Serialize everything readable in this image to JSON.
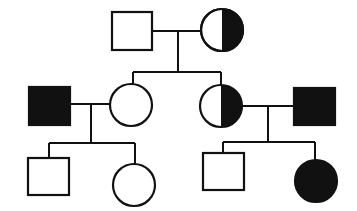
{
  "diagram": {
    "type": "pedigree",
    "colors": {
      "affected": "#111111",
      "unaffected": "#ffffff",
      "outline": "#111111"
    },
    "individuals": [
      {
        "id": "I-1",
        "generation": 1,
        "sex": "male",
        "status": "unaffected"
      },
      {
        "id": "I-2",
        "generation": 1,
        "sex": "female",
        "status": "carrier"
      },
      {
        "id": "II-1",
        "generation": 2,
        "sex": "male",
        "status": "affected"
      },
      {
        "id": "II-2",
        "generation": 2,
        "sex": "female",
        "status": "unaffected"
      },
      {
        "id": "II-3",
        "generation": 2,
        "sex": "female",
        "status": "carrier"
      },
      {
        "id": "II-4",
        "generation": 2,
        "sex": "male",
        "status": "affected"
      },
      {
        "id": "III-1",
        "generation": 3,
        "sex": "male",
        "status": "unaffected"
      },
      {
        "id": "III-2",
        "generation": 3,
        "sex": "female",
        "status": "unaffected"
      },
      {
        "id": "III-3",
        "generation": 3,
        "sex": "male",
        "status": "unaffected"
      },
      {
        "id": "III-4",
        "generation": 3,
        "sex": "female",
        "status": "affected"
      }
    ],
    "matings": [
      {
        "partners": [
          "I-1",
          "I-2"
        ],
        "children": [
          "II-2",
          "II-3"
        ]
      },
      {
        "partners": [
          "II-1",
          "II-2"
        ],
        "children": [
          "III-1",
          "III-2"
        ]
      },
      {
        "partners": [
          "II-3",
          "II-4"
        ],
        "children": [
          "III-3",
          "III-4"
        ]
      }
    ]
  }
}
